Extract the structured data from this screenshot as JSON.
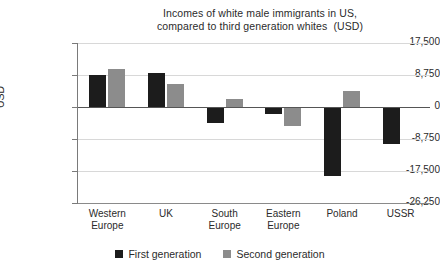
{
  "chart_data": {
    "type": "bar",
    "title": "Incomes of white male immigrants in US, compared to third generation whites  (USD)",
    "title_lines": [
      "Incomes of white male immigrants in US,",
      "compared to third generation whites  (USD)"
    ],
    "xlabel": "",
    "ylabel": "USD",
    "ylim": [
      -26250,
      17500
    ],
    "yticks": [
      17500,
      8750,
      0,
      -8750,
      -17500,
      -26250
    ],
    "ytick_labels": [
      "17,500",
      "8,750",
      "0",
      "-8,750",
      "-17,500",
      "-26,250"
    ],
    "grid": true,
    "legend_position": "bottom-center",
    "categories": [
      "Western Europe",
      "UK",
      "South Europe",
      "Eastern Europe",
      "Poland",
      "USSR"
    ],
    "category_lines": [
      [
        "Western",
        "Europe"
      ],
      [
        "UK",
        ""
      ],
      [
        "South",
        "Europe"
      ],
      [
        "Eastern",
        "Europe"
      ],
      [
        "Poland",
        ""
      ],
      [
        "USSR",
        ""
      ]
    ],
    "series": [
      {
        "name": "First generation",
        "color": "#1c1c1c",
        "values": [
          8750,
          9200,
          -4300,
          -2000,
          -19000,
          -10000
        ]
      },
      {
        "name": "Second generation",
        "color": "#8c8c8c",
        "values": [
          10400,
          6300,
          2200,
          -5200,
          4300,
          null
        ]
      }
    ]
  },
  "legend": {
    "items": [
      {
        "label": "First generation",
        "color": "#1c1c1c"
      },
      {
        "label": "Second generation",
        "color": "#8c8c8c"
      }
    ]
  }
}
